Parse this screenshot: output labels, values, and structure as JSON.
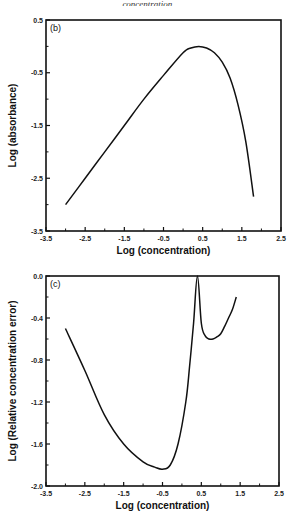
{
  "caption": "concentration.",
  "chart_data": [
    {
      "type": "line",
      "panel_label": "(b)",
      "title": "",
      "xlabel": "Log (concentration)",
      "ylabel": "Log (absorbance)",
      "xlim": [
        -3.5,
        2.5
      ],
      "ylim": [
        -3.5,
        0.5
      ],
      "x_ticks": [
        "-3.5",
        "-2.5",
        "-1.5",
        "-0.5",
        "0.5",
        "1.5",
        "2.5"
      ],
      "y_ticks": [
        "0.5",
        "-0.5",
        "-1.5",
        "-2.5",
        "-3.5"
      ],
      "grid": false,
      "legend": null,
      "series": [
        {
          "name": "absorbance",
          "x": [
            -3.0,
            -2.5,
            -2.0,
            -1.5,
            -1.0,
            -0.5,
            0.0,
            0.2,
            0.4,
            0.6,
            0.8,
            1.0,
            1.2,
            1.4,
            1.6,
            1.8
          ],
          "y": [
            -3.0,
            -2.5,
            -2.0,
            -1.5,
            -1.0,
            -0.55,
            -0.12,
            -0.03,
            0.0,
            -0.03,
            -0.12,
            -0.3,
            -0.6,
            -1.1,
            -1.8,
            -2.85
          ]
        }
      ]
    },
    {
      "type": "line",
      "panel_label": "(c)",
      "title": "",
      "xlabel": "Log (concentration)",
      "ylabel": "Log (Relative concentration error)",
      "xlim": [
        -3.5,
        2.5
      ],
      "ylim": [
        -2.0,
        0.0
      ],
      "x_ticks": [
        "-3.5",
        "-2.5",
        "-1.5",
        "-0.5",
        "0.5",
        "1.5",
        "2.5"
      ],
      "y_ticks": [
        "0.0",
        "-0.4",
        "-0.8",
        "-1.2",
        "-1.6",
        "-2.0"
      ],
      "grid": false,
      "legend": null,
      "series": [
        {
          "name": "relative error",
          "x": [
            -3.0,
            -2.5,
            -2.0,
            -1.5,
            -1.0,
            -0.7,
            -0.5,
            -0.3,
            -0.1,
            0.1,
            0.2,
            0.3,
            0.4,
            0.5,
            0.6,
            0.7,
            0.8,
            0.9,
            1.0,
            1.1,
            1.2,
            1.3,
            1.4
          ],
          "y": [
            -0.5,
            -0.9,
            -1.32,
            -1.6,
            -1.77,
            -1.82,
            -1.84,
            -1.8,
            -1.6,
            -1.2,
            -0.85,
            -0.45,
            0.0,
            -0.45,
            -0.57,
            -0.6,
            -0.6,
            -0.58,
            -0.55,
            -0.48,
            -0.4,
            -0.32,
            -0.2
          ]
        }
      ]
    }
  ]
}
